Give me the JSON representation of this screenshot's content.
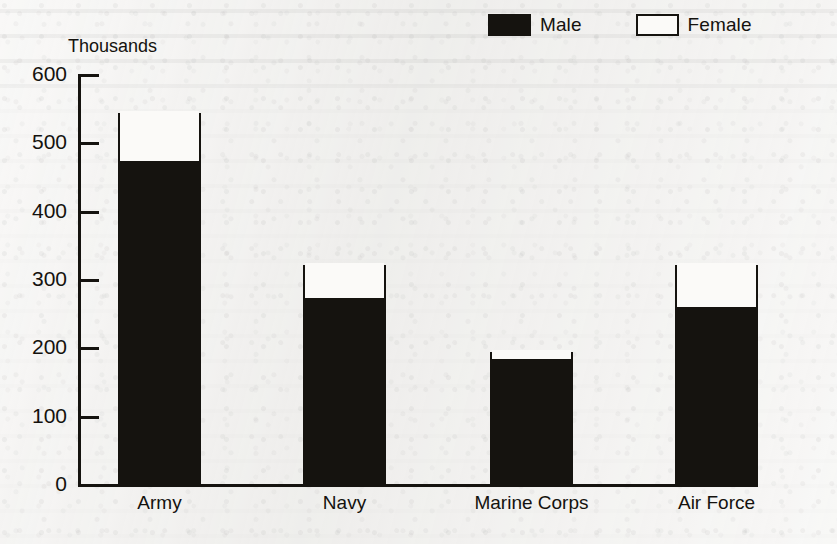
{
  "chart_data": {
    "type": "bar",
    "subtype": "stacked-vertical",
    "title": "",
    "xlabel": "",
    "ylabel": "Thousands",
    "ylim": [
      0,
      600
    ],
    "yticks": [
      0,
      100,
      200,
      300,
      400,
      500,
      600
    ],
    "ytick_labels": [
      "0",
      "100",
      "200",
      "300",
      "400",
      "500",
      "600"
    ],
    "grid": false,
    "legend_position": "top-right",
    "categories": [
      "Army",
      "Navy",
      "Marine Corps",
      "Air Force"
    ],
    "series": [
      {
        "name": "Male",
        "color": "#15130f",
        "values": [
          470,
          269,
          180,
          256
        ]
      },
      {
        "name": "Female",
        "color": "#fbfaf8",
        "values": [
          73,
          51,
          13,
          64
        ]
      }
    ],
    "totals": [
      543,
      320,
      193,
      320
    ],
    "units": "thousands"
  },
  "legend": {
    "entries": [
      {
        "label": "Male",
        "swatch": "filled-square-icon"
      },
      {
        "label": "Female",
        "swatch": "hollow-square-icon"
      }
    ]
  },
  "axis": {
    "y_title": "Thousands"
  }
}
